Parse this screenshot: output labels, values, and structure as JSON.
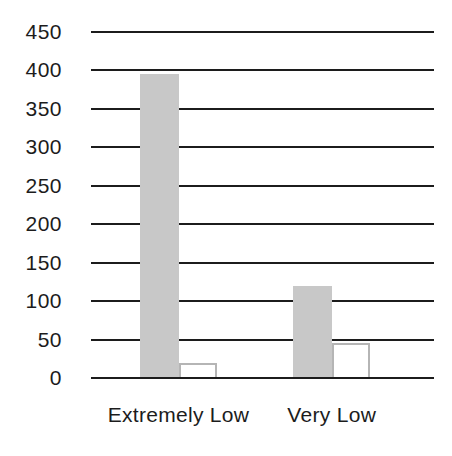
{
  "chart_data": {
    "type": "bar",
    "title": "",
    "xlabel": "",
    "ylabel": "",
    "categories": [
      "Extremely Low",
      "Very Low"
    ],
    "series": [
      {
        "name": "gray-filled-bars",
        "values": [
          395,
          120
        ],
        "fill": "#c8c8c8",
        "border": ""
      },
      {
        "name": "white-outlined-bars",
        "values": [
          20,
          45
        ],
        "fill": "#ffffff",
        "border": "#b5b5b5"
      }
    ],
    "ylim": [
      0,
      450
    ],
    "ytick_step": 50,
    "yticks": [
      450,
      400,
      350,
      300,
      250,
      200,
      150,
      100,
      50,
      0
    ],
    "grid": true,
    "legend": false
  },
  "colors": {
    "background": "#ffffff",
    "gridline": "#1c1c1c",
    "text": "#1c1c1c"
  }
}
